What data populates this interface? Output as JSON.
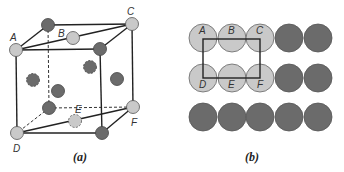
{
  "colors": {
    "light_atom": "#c9c9c9",
    "dark_atom": "#6b6b6b",
    "line": "#222222",
    "atom_stroke": "#555555"
  },
  "panel_a": {
    "caption": "(a)",
    "labels": {
      "A": "A",
      "B": "B",
      "C": "C",
      "D": "D",
      "E": "E",
      "F": "F"
    }
  },
  "panel_b": {
    "caption": "(b)",
    "row1_labels": [
      "A",
      "B",
      "C"
    ],
    "row2_labels": [
      "D",
      "E",
      "F"
    ],
    "rows": [
      [
        "light",
        "light",
        "light",
        "dark",
        "dark"
      ],
      [
        "light",
        "light",
        "light",
        "dark",
        "dark"
      ],
      [
        "dark",
        "dark",
        "dark",
        "dark",
        "dark"
      ]
    ]
  }
}
